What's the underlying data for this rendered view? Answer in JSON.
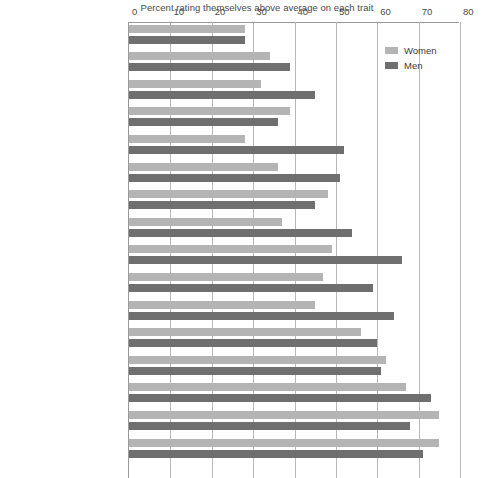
{
  "chart_data": {
    "type": "bar",
    "orientation": "horizontal",
    "title": "Percent rating themselves above average on each trait",
    "xlabel": "",
    "ylabel": "",
    "xlim": [
      0,
      80
    ],
    "xticks": [
      0,
      10,
      20,
      30,
      40,
      50,
      60,
      70,
      80
    ],
    "grid": true,
    "legend_position": "top-right",
    "colors": {
      "women": "#b4b4b4",
      "men": "#6f6f6f"
    },
    "categories": [
      "Artistic ability",
      "Public speaking ability",
      "Popularity",
      "Spirituality",
      "Computer skills",
      "Risk taking",
      "Writing ability",
      "Mathematical ability",
      "Self-confidence",
      "Emotional health",
      "Physical health",
      "Leadership ability",
      "Understanding of others",
      "Academic ability",
      "Drive to achieve",
      "Cooperativeness"
    ],
    "series": [
      {
        "name": "Women",
        "color": "#b4b4b4",
        "values": [
          28,
          34,
          32,
          39,
          28,
          36,
          48,
          37,
          49,
          47,
          45,
          56,
          62,
          67,
          75,
          75
        ]
      },
      {
        "name": "Men",
        "color": "#6f6f6f",
        "values": [
          28,
          39,
          45,
          36,
          52,
          51,
          45,
          54,
          66,
          59,
          64,
          60,
          61,
          73,
          68,
          71
        ]
      }
    ]
  },
  "legend": {
    "items": [
      {
        "label": "Women",
        "color": "#b4b4b4"
      },
      {
        "label": "Men",
        "color": "#6f6f6f"
      }
    ]
  }
}
